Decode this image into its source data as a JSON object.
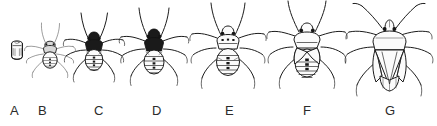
{
  "figure": {
    "background_color": "#ffffff",
    "ink_color": "#1c1c1c",
    "label_color": "#2b2b2b",
    "width": 437,
    "height": 126,
    "style": "black ink line drawing",
    "label_row_y": 104
  },
  "stages": [
    {
      "label": "A",
      "name": "egg",
      "description": "barrel-shaped egg with operculum cap",
      "label_x": 10,
      "draw_x": 6,
      "draw_y": 38,
      "draw_w": 22,
      "draw_h": 26,
      "scale": 0.3
    },
    {
      "label": "B",
      "name": "first-instar-nymph",
      "description": "smallest nymph, pale abdomen, long splayed legs",
      "label_x": 38,
      "draw_x": 22,
      "draw_y": 20,
      "draw_w": 54,
      "draw_h": 62,
      "scale": 0.46
    },
    {
      "label": "C",
      "name": "second-instar-nymph",
      "description": "dark head and thorax, banded abdomen",
      "label_x": 94,
      "draw_x": 62,
      "draw_y": 12,
      "draw_w": 62,
      "draw_h": 72,
      "scale": 0.58
    },
    {
      "label": "D",
      "name": "third-instar-nymph",
      "description": "black thorax, segmented striped abdomen",
      "label_x": 152,
      "draw_x": 118,
      "draw_y": 8,
      "draw_w": 70,
      "draw_h": 80,
      "scale": 0.68
    },
    {
      "label": "E",
      "name": "fourth-instar-nymph",
      "description": "pale body with dark midline spots, small wing pads",
      "label_x": 225,
      "draw_x": 188,
      "draw_y": 4,
      "draw_w": 78,
      "draw_h": 88,
      "scale": 0.8
    },
    {
      "label": "F",
      "name": "fifth-instar-nymph",
      "description": "enlarged wing pads, row of dark dorsal spots",
      "label_x": 303,
      "draw_x": 264,
      "draw_y": 2,
      "draw_w": 84,
      "draw_h": 92,
      "scale": 0.88
    },
    {
      "label": "G",
      "name": "adult",
      "description": "shield-shaped adult with scutellum and folded wings",
      "label_x": 385,
      "draw_x": 342,
      "draw_y": 0,
      "draw_w": 94,
      "draw_h": 100,
      "scale": 1.0
    }
  ]
}
